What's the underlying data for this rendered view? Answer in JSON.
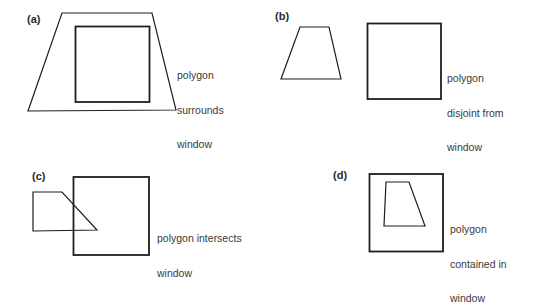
{
  "panels": [
    {
      "label": "(a)",
      "caption_lines": [
        "polygon",
        "surrounds",
        "window"
      ],
      "relation": "polygon surrounds window"
    },
    {
      "label": "(b)",
      "caption_lines": [
        "polygon",
        "disjoint from",
        "window"
      ],
      "relation": "polygon disjoint from window"
    },
    {
      "label": "(c)",
      "caption_lines": [
        "polygon intersects",
        "window"
      ],
      "relation": "polygon intersects window"
    },
    {
      "label": "(d)",
      "caption_lines": [
        "polygon",
        "contained in",
        "window"
      ],
      "relation": "polygon contained in window"
    }
  ],
  "colors": {
    "stroke": "#1e1e1e",
    "background": "#ffffff",
    "text": "#3a3a3a"
  }
}
